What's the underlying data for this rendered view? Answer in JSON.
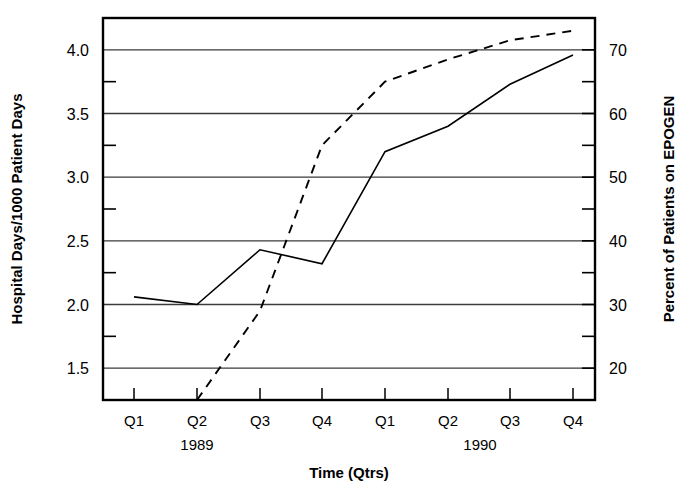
{
  "chart_data": {
    "type": "line",
    "title": "",
    "xlabel": "Time (Qtrs)",
    "ylabel": "Hospital Days/1000 Patient Days",
    "y2label": "Percent of Patients on EPOGEN",
    "categories": [
      "Q1",
      "Q2",
      "Q3",
      "Q4",
      "Q1",
      "Q2",
      "Q3",
      "Q4"
    ],
    "group_labels": [
      "1989",
      "1990"
    ],
    "ylim": [
      1.25,
      4.25
    ],
    "y2lim": [
      15,
      75
    ],
    "yticks": [
      "1.5",
      "2.0",
      "2.5",
      "3.0",
      "3.5",
      "4.0"
    ],
    "ytick_values": [
      1.5,
      2.0,
      2.5,
      3.0,
      3.5,
      4.0
    ],
    "yminor_values": [
      1.75,
      2.25,
      2.75,
      3.25,
      3.75
    ],
    "y2ticks": [
      "20",
      "30",
      "40",
      "50",
      "60",
      "70"
    ],
    "y2tick_values": [
      20,
      30,
      40,
      50,
      60,
      70
    ],
    "y2minor_values": [
      25,
      35,
      45,
      55,
      65
    ],
    "grid": true,
    "legend": "none",
    "series": [
      {
        "name": "Hospital Days/1000 Patient Days",
        "axis": "left",
        "style": "solid",
        "x": [
          "Q1 1989",
          "Q2 1989",
          "Q3 1989",
          "Q4 1989",
          "Q1 1990",
          "Q2 1990",
          "Q3 1990",
          "Q4 1990"
        ],
        "values": [
          2.06,
          2.0,
          2.43,
          2.32,
          3.2,
          3.4,
          3.73,
          3.96
        ]
      },
      {
        "name": "Percent of Patients on EPOGEN",
        "axis": "right",
        "style": "dashed",
        "x": [
          "Q2 1989",
          "Q3 1989",
          "Q4 1989",
          "Q1 1990",
          "Q2 1990",
          "Q3 1990",
          "Q4 1990"
        ],
        "values": [
          15.0,
          29.0,
          55.0,
          65.0,
          68.5,
          71.5,
          73.0
        ]
      }
    ]
  },
  "geometry": {
    "plot_left": 103,
    "plot_right": 595,
    "plot_top": 18,
    "plot_bottom": 400,
    "cat_x": [
      134,
      197,
      260,
      322,
      385,
      448,
      510,
      573
    ],
    "year_x": [
      197,
      480
    ],
    "cat_label_y": 426,
    "year_label_y": 450,
    "xlabel_y": 478,
    "ylabel_x": 22,
    "y2label_x": 674
  }
}
